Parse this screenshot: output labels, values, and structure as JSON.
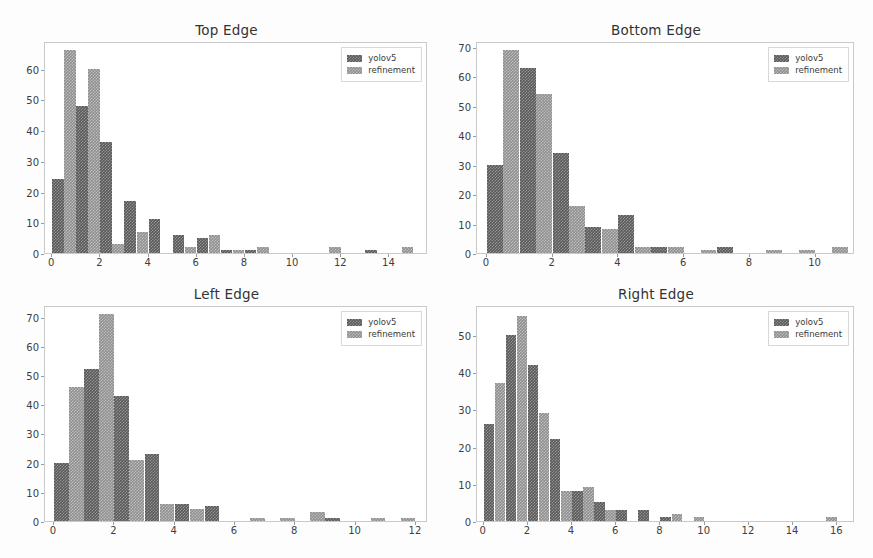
{
  "figure": {
    "background_color": "#fdfdfd",
    "series_colors": [
      "#5a5a5a",
      "#8f8f8f"
    ],
    "rows": 2,
    "cols": 2
  },
  "chart_data": [
    {
      "type": "bar",
      "title": "Top Edge",
      "xlabel": "",
      "ylabel": "",
      "grid": false,
      "legend_position": "upper right",
      "xlim": [
        -0.3,
        15.6
      ],
      "ylim": [
        0,
        69
      ],
      "xticks": [
        0,
        2,
        4,
        6,
        8,
        10,
        12,
        14
      ],
      "yticks": [
        0,
        10,
        20,
        30,
        40,
        50,
        60
      ],
      "bin_starts": [
        0,
        1,
        2,
        3,
        4,
        5,
        6,
        7,
        8,
        9,
        10,
        11,
        12,
        13,
        14
      ],
      "bin_width": 1,
      "series": [
        {
          "name": "yolov5",
          "values": [
            24,
            48,
            36,
            17,
            11,
            6,
            5,
            1,
            1,
            0,
            0,
            0,
            0,
            1,
            0
          ]
        },
        {
          "name": "refinement",
          "values": [
            66,
            60,
            3,
            7,
            0,
            2,
            6,
            1,
            2,
            0,
            0,
            2,
            0,
            0,
            2
          ]
        }
      ]
    },
    {
      "type": "bar",
      "title": "Bottom Edge",
      "xlabel": "",
      "ylabel": "",
      "grid": false,
      "legend_position": "upper right",
      "xlim": [
        -0.3,
        11.2
      ],
      "ylim": [
        0,
        72
      ],
      "xticks": [
        0,
        2,
        4,
        6,
        8,
        10
      ],
      "yticks": [
        0,
        10,
        20,
        30,
        40,
        50,
        60,
        70
      ],
      "bin_starts": [
        0,
        1,
        2,
        3,
        4,
        5,
        6,
        7,
        8,
        9,
        10
      ],
      "bin_width": 1,
      "series": [
        {
          "name": "yolov5",
          "values": [
            30,
            63,
            34,
            9,
            13,
            2,
            0,
            2,
            0,
            0,
            0
          ]
        },
        {
          "name": "refinement",
          "values": [
            69,
            54,
            16,
            8,
            2,
            2,
            1,
            0,
            1,
            1,
            2
          ]
        }
      ]
    },
    {
      "type": "bar",
      "title": "Left Edge",
      "xlabel": "",
      "ylabel": "",
      "grid": false,
      "legend_position": "upper right",
      "xlim": [
        -0.3,
        12.4
      ],
      "ylim": [
        0,
        74
      ],
      "xticks": [
        0,
        2,
        4,
        6,
        8,
        10,
        12
      ],
      "yticks": [
        0,
        10,
        20,
        30,
        40,
        50,
        60,
        70
      ],
      "bin_starts": [
        0,
        1,
        2,
        3,
        4,
        5,
        6,
        7,
        8,
        9,
        10,
        11
      ],
      "bin_width": 1,
      "series": [
        {
          "name": "yolov5",
          "values": [
            20,
            52,
            43,
            23,
            6,
            5,
            0,
            0,
            0,
            1,
            0,
            0
          ]
        },
        {
          "name": "refinement",
          "values": [
            46,
            71,
            21,
            6,
            4,
            0,
            1,
            1,
            3,
            0,
            1,
            1
          ]
        }
      ]
    },
    {
      "type": "bar",
      "title": "Right Edge",
      "xlabel": "",
      "ylabel": "",
      "grid": false,
      "legend_position": "upper right",
      "xlim": [
        -0.3,
        16.8
      ],
      "ylim": [
        0,
        58
      ],
      "xticks": [
        0,
        2,
        4,
        6,
        8,
        10,
        12,
        14,
        16
      ],
      "yticks": [
        0,
        10,
        20,
        30,
        40,
        50
      ],
      "bin_starts": [
        0,
        1,
        2,
        3,
        4,
        5,
        6,
        7,
        8,
        9,
        10,
        11,
        12,
        13,
        14,
        15
      ],
      "bin_width": 1,
      "series": [
        {
          "name": "yolov5",
          "values": [
            26,
            50,
            42,
            22,
            8,
            5,
            3,
            3,
            1,
            0,
            0,
            0,
            0,
            0,
            0,
            0
          ]
        },
        {
          "name": "refinement",
          "values": [
            37,
            55,
            29,
            8,
            9,
            3,
            0,
            0,
            2,
            1,
            0,
            0,
            0,
            0,
            0,
            1
          ]
        }
      ]
    }
  ]
}
